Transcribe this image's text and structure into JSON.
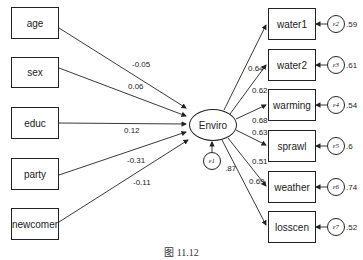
{
  "latent": {
    "label": "Enviro",
    "error": {
      "label": "ε1",
      "variance": ".87"
    }
  },
  "predictors": [
    {
      "label": "age",
      "coef": "-0.05"
    },
    {
      "label": "sex",
      "coef": "0.06"
    },
    {
      "label": "educ",
      "coef": "0.12"
    },
    {
      "label": "party",
      "coef": "-0.31"
    },
    {
      "label": "newcomer",
      "coef": "-0.11"
    }
  ],
  "indicators": [
    {
      "label": "water1",
      "loading": "0.64",
      "error": "ε2",
      "variance": ".59"
    },
    {
      "label": "water2",
      "loading": "0.62",
      "error": "ε3",
      "variance": ".61"
    },
    {
      "label": "warming",
      "loading": "0.68",
      "error": "ε4",
      "variance": ".54"
    },
    {
      "label": "sprawl",
      "loading": "0.63",
      "error": "ε5",
      "variance": ".6"
    },
    {
      "label": "weather",
      "loading": "0.51",
      "error": "ε6",
      "variance": ".74"
    },
    {
      "label": "losscen",
      "loading": "0.69",
      "error": "ε7",
      "variance": ".52"
    }
  ],
  "caption": "图 11.12"
}
